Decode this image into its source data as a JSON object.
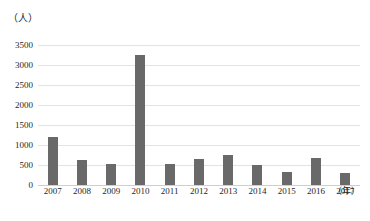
{
  "chart_data": {
    "type": "bar",
    "title": "",
    "subtitle": "",
    "xlabel": "（年）",
    "ylabel": "（人）",
    "categories": [
      "2007",
      "2008",
      "2009",
      "2010",
      "2011",
      "2012",
      "2013",
      "2014",
      "2015",
      "2016",
      "2017"
    ],
    "values": [
      1200,
      620,
      530,
      3250,
      530,
      650,
      760,
      490,
      330,
      680,
      310
    ],
    "series": [
      {
        "name": "人数",
        "values": [
          1200,
          620,
          530,
          3250,
          530,
          650,
          760,
          490,
          330,
          680,
          310
        ]
      }
    ],
    "ylim": [
      0,
      3500
    ],
    "ytick_values": [
      0,
      500,
      1000,
      1500,
      2000,
      2500,
      3000,
      3500
    ],
    "ytick_labels": [
      "0",
      "500",
      "1000",
      "1500",
      "2000",
      "2500",
      "3000",
      "3500"
    ],
    "grid": true,
    "grid_axis": "y",
    "legend": false,
    "legend_position": "none",
    "bar_color": "#696969",
    "gridline_color": "#e3e3e3",
    "axis_color": "#cfcfcf",
    "text_color": "#1f1f1f",
    "background": "#ffffff"
  },
  "axis": {
    "y_unit_label": "（人）",
    "x_unit_label": "（年）"
  }
}
